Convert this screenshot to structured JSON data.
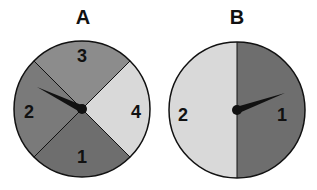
{
  "spinners": [
    {
      "title": "A",
      "sections": [
        {
          "label": "3",
          "color": "#8c8c8c"
        },
        {
          "label": "4",
          "color": "#d9d9d9"
        },
        {
          "label": "1",
          "color": "#6e6e6e"
        },
        {
          "label": "2",
          "color": "#7a7a7a"
        }
      ],
      "pointer_points_to": "2"
    },
    {
      "title": "B",
      "sections": [
        {
          "label": "1",
          "color": "#6e6e6e"
        },
        {
          "label": "2",
          "color": "#d9d9d9"
        }
      ],
      "pointer_points_to": "1"
    }
  ]
}
